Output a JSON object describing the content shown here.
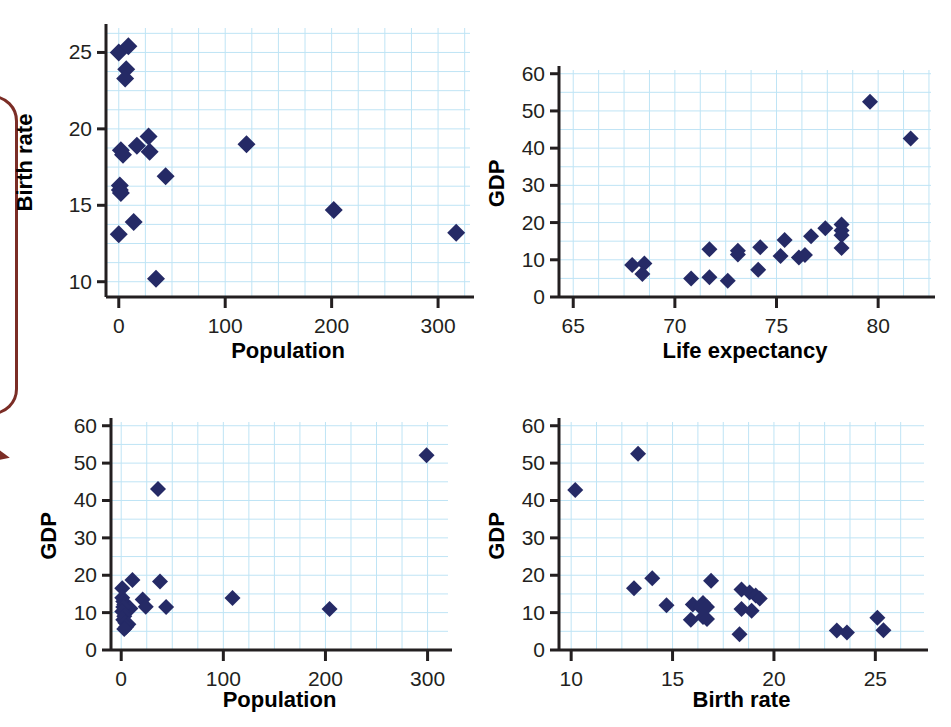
{
  "figure": {
    "kind": "scatterplot-matrix",
    "panel_count": 4,
    "marker_color": "#252a66",
    "gridline_color": "#bfe4f5",
    "axis_color": "#231f20",
    "callout_color": "#7b2d26"
  },
  "chart_data": [
    {
      "id": "pop-vs-birth",
      "type": "scatter",
      "title": "",
      "xlabel": "Population",
      "ylabel": "Birth rate",
      "xlim": [
        -12,
        330
      ],
      "ylim": [
        9.0,
        26.6
      ],
      "xticks": [
        0,
        100,
        200,
        300
      ],
      "yticks": [
        10,
        15,
        20,
        25
      ],
      "xtick_labels": [
        "0",
        "100",
        "200",
        "300"
      ],
      "ytick_labels": [
        "10",
        "15",
        "20",
        "25"
      ],
      "grid": true,
      "grid_x_step": 25,
      "grid_y_step": 1.25,
      "legend": "none",
      "points": [
        {
          "x": 0,
          "y": 25.0
        },
        {
          "x": 9,
          "y": 25.4
        },
        {
          "x": 7,
          "y": 23.9
        },
        {
          "x": 6,
          "y": 23.3
        },
        {
          "x": 28,
          "y": 19.5
        },
        {
          "x": 17,
          "y": 18.9
        },
        {
          "x": 2,
          "y": 18.6
        },
        {
          "x": 4,
          "y": 18.3
        },
        {
          "x": 29,
          "y": 18.5
        },
        {
          "x": 44,
          "y": 16.9
        },
        {
          "x": 1,
          "y": 16.3
        },
        {
          "x": 1,
          "y": 16.0
        },
        {
          "x": 2,
          "y": 15.8
        },
        {
          "x": 120,
          "y": 19.0
        },
        {
          "x": 14,
          "y": 13.9
        },
        {
          "x": 0,
          "y": 13.1
        },
        {
          "x": 202,
          "y": 14.7
        },
        {
          "x": 317,
          "y": 13.2
        },
        {
          "x": 35,
          "y": 10.2
        }
      ]
    },
    {
      "id": "life-vs-gdp",
      "type": "scatter",
      "title": "",
      "xlabel": "Life expectancy",
      "ylabel": "GDP",
      "xlim": [
        64.3,
        82.6
      ],
      "ylim": [
        0,
        61
      ],
      "xticks": [
        65,
        70,
        75,
        80
      ],
      "yticks": [
        0,
        10,
        20,
        30,
        40,
        50,
        60
      ],
      "xtick_labels": [
        "65",
        "70",
        "75",
        "80"
      ],
      "ytick_labels": [
        "0",
        "10",
        "20",
        "30",
        "40",
        "50",
        "60"
      ],
      "grid": true,
      "grid_x_step": 1.25,
      "grid_y_step": 5,
      "legend": "none",
      "points": [
        {
          "x": 67.9,
          "y": 8.6
        },
        {
          "x": 68.5,
          "y": 9.0
        },
        {
          "x": 68.4,
          "y": 6.2
        },
        {
          "x": 70.8,
          "y": 5.0
        },
        {
          "x": 71.7,
          "y": 5.3
        },
        {
          "x": 71.7,
          "y": 12.8
        },
        {
          "x": 72.6,
          "y": 4.4
        },
        {
          "x": 73.1,
          "y": 11.4
        },
        {
          "x": 73.1,
          "y": 12.4
        },
        {
          "x": 74.2,
          "y": 13.4
        },
        {
          "x": 74.1,
          "y": 7.3
        },
        {
          "x": 75.2,
          "y": 11.0
        },
        {
          "x": 75.4,
          "y": 15.3
        },
        {
          "x": 76.1,
          "y": 10.6
        },
        {
          "x": 76.4,
          "y": 11.3
        },
        {
          "x": 76.7,
          "y": 16.3
        },
        {
          "x": 77.4,
          "y": 18.5
        },
        {
          "x": 78.2,
          "y": 19.5
        },
        {
          "x": 78.2,
          "y": 17.9
        },
        {
          "x": 78.2,
          "y": 16.6
        },
        {
          "x": 78.2,
          "y": 13.2
        },
        {
          "x": 79.6,
          "y": 52.5
        },
        {
          "x": 81.6,
          "y": 42.6
        }
      ]
    },
    {
      "id": "pop-vs-gdp",
      "type": "scatter",
      "title": "",
      "xlabel": "Population",
      "ylabel": "GDP",
      "xlim": [
        -10,
        320
      ],
      "ylim": [
        0,
        61
      ],
      "xticks": [
        0,
        100,
        200,
        300
      ],
      "yticks": [
        0,
        10,
        20,
        30,
        40,
        50,
        60
      ],
      "xtick_labels": [
        "0",
        "100",
        "200",
        "300"
      ],
      "ytick_labels": [
        "0",
        "10",
        "20",
        "30",
        "40",
        "50",
        "60"
      ],
      "grid": true,
      "grid_x_step": 25,
      "grid_y_step": 5,
      "legend": "none",
      "points": [
        {
          "x": 1,
          "y": 16.5
        },
        {
          "x": 11,
          "y": 18.7
        },
        {
          "x": 38,
          "y": 18.3
        },
        {
          "x": 1,
          "y": 14.0
        },
        {
          "x": 2,
          "y": 13.0
        },
        {
          "x": 3,
          "y": 12.2
        },
        {
          "x": 5,
          "y": 11.4
        },
        {
          "x": 9,
          "y": 11.1
        },
        {
          "x": 2,
          "y": 11.5
        },
        {
          "x": 1,
          "y": 10.3
        },
        {
          "x": 21,
          "y": 13.5
        },
        {
          "x": 24,
          "y": 11.6
        },
        {
          "x": 44,
          "y": 11.5
        },
        {
          "x": 3,
          "y": 9.0
        },
        {
          "x": 2,
          "y": 8.1
        },
        {
          "x": 4,
          "y": 7.3
        },
        {
          "x": 7,
          "y": 6.9
        },
        {
          "x": 5,
          "y": 6.2
        },
        {
          "x": 3,
          "y": 5.6
        },
        {
          "x": 36,
          "y": 43.1
        },
        {
          "x": 109,
          "y": 13.9
        },
        {
          "x": 204,
          "y": 11.0
        },
        {
          "x": 299,
          "y": 52.1
        }
      ]
    },
    {
      "id": "birth-vs-gdp",
      "type": "scatter",
      "title": "",
      "xlabel": "Birth rate",
      "ylabel": "GDP",
      "xlim": [
        9.4,
        27.4
      ],
      "ylim": [
        0,
        61
      ],
      "xticks": [
        10,
        15,
        20,
        25
      ],
      "yticks": [
        0,
        10,
        20,
        30,
        40,
        50,
        60
      ],
      "xtick_labels": [
        "10",
        "15",
        "20",
        "25"
      ],
      "ytick_labels": [
        "0",
        "10",
        "20",
        "30",
        "40",
        "50",
        "60"
      ],
      "grid": true,
      "grid_x_step": 1.25,
      "grid_y_step": 5,
      "legend": "none",
      "points": [
        {
          "x": 10.2,
          "y": 42.8
        },
        {
          "x": 13.3,
          "y": 52.5
        },
        {
          "x": 13.1,
          "y": 16.5
        },
        {
          "x": 14.0,
          "y": 19.2
        },
        {
          "x": 14.7,
          "y": 12.0
        },
        {
          "x": 15.9,
          "y": 8.1
        },
        {
          "x": 16.0,
          "y": 12.2
        },
        {
          "x": 16.4,
          "y": 11.3
        },
        {
          "x": 16.5,
          "y": 12.6
        },
        {
          "x": 16.5,
          "y": 8.8
        },
        {
          "x": 16.7,
          "y": 11.5
        },
        {
          "x": 16.7,
          "y": 8.3
        },
        {
          "x": 16.9,
          "y": 18.5
        },
        {
          "x": 18.3,
          "y": 4.2
        },
        {
          "x": 18.4,
          "y": 16.2
        },
        {
          "x": 18.4,
          "y": 11.0
        },
        {
          "x": 18.8,
          "y": 15.4
        },
        {
          "x": 18.9,
          "y": 10.5
        },
        {
          "x": 19.1,
          "y": 14.6
        },
        {
          "x": 19.3,
          "y": 13.8
        },
        {
          "x": 23.1,
          "y": 5.2
        },
        {
          "x": 23.6,
          "y": 4.7
        },
        {
          "x": 25.1,
          "y": 8.6
        },
        {
          "x": 25.4,
          "y": 5.3
        }
      ]
    }
  ]
}
